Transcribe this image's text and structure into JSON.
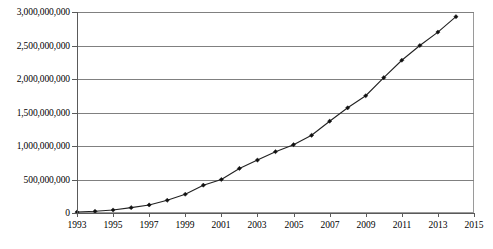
{
  "chart_data": {
    "type": "line",
    "title": "",
    "subtitle": "",
    "xlabel": "",
    "ylabel": "",
    "grid": true,
    "legend": false,
    "legend_position": "none",
    "xlim": [
      1993,
      2015
    ],
    "ylim": [
      0,
      3000000000
    ],
    "x_tick_labels": [
      "1993",
      "1995",
      "1997",
      "1999",
      "2001",
      "2003",
      "2005",
      "2007",
      "2009",
      "2011",
      "2013",
      "2015"
    ],
    "x_tick_values": [
      1993,
      1995,
      1997,
      1999,
      2001,
      2003,
      2005,
      2007,
      2009,
      2011,
      2013,
      2015
    ],
    "y_tick_labels": [
      "0",
      "500,000,000",
      "1,000,000,000",
      "1,500,000,000",
      "2,000,000,000",
      "2,500,000,000",
      "3,000,000,000"
    ],
    "y_tick_values": [
      0,
      500000000,
      1000000000,
      1500000000,
      2000000000,
      2500000000,
      3000000000
    ],
    "x": [
      1993,
      1994,
      1995,
      1996,
      1997,
      1998,
      1999,
      2000,
      2001,
      2002,
      2003,
      2004,
      2005,
      2006,
      2007,
      2008,
      2009,
      2010,
      2011,
      2012,
      2013,
      2014
    ],
    "values": [
      14000000,
      25000000,
      45000000,
      80000000,
      120000000,
      190000000,
      280000000,
      415000000,
      500000000,
      665000000,
      790000000,
      915000000,
      1020000000,
      1160000000,
      1370000000,
      1570000000,
      1750000000,
      2020000000,
      2280000000,
      2500000000,
      2700000000,
      2930000000
    ],
    "series": [
      {
        "name": "",
        "values": [
          14000000,
          25000000,
          45000000,
          80000000,
          120000000,
          190000000,
          280000000,
          415000000,
          500000000,
          665000000,
          790000000,
          915000000,
          1020000000,
          1160000000,
          1370000000,
          1570000000,
          1750000000,
          2020000000,
          2280000000,
          2500000000,
          2700000000,
          2930000000
        ],
        "marker": "diamond",
        "color": "#222222"
      }
    ],
    "annotations": []
  },
  "colors": {
    "line": "#222222",
    "marker": "#111111",
    "grid": "#808080",
    "axis": "#5a5a5a",
    "frame": "#9a9a9a",
    "background": "#ffffff"
  }
}
